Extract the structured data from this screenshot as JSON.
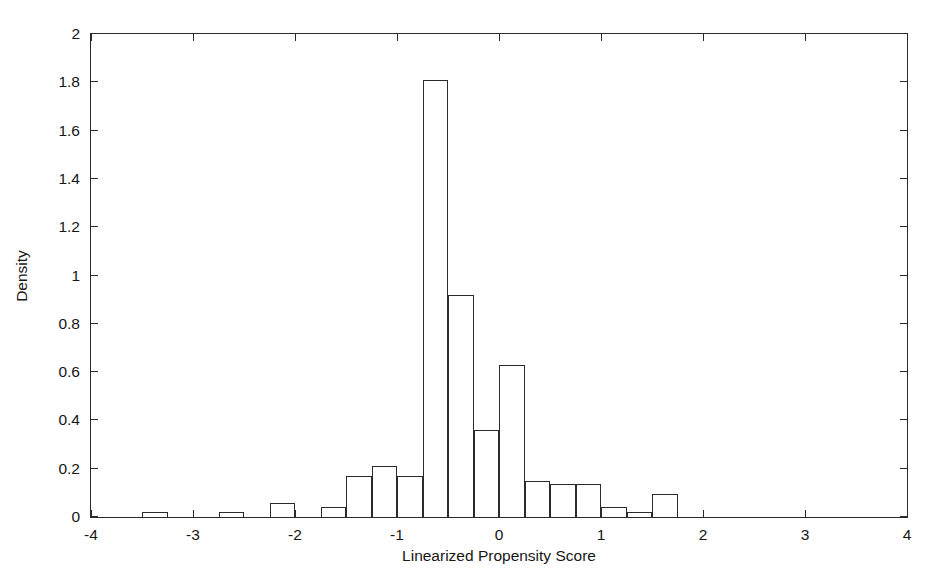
{
  "chart_data": {
    "type": "bar",
    "title": "",
    "subtitle": "",
    "xlabel": "Linearized Propensity Score",
    "ylabel": "Density",
    "xlim": [
      -4,
      4
    ],
    "ylim": [
      0,
      2
    ],
    "grid": false,
    "legend": null,
    "bin_width": 0.25,
    "xticks": [
      -4,
      -3,
      -2,
      -1,
      0,
      1,
      2,
      3,
      4
    ],
    "xtick_labels": [
      "-4",
      "-3",
      "-2",
      "-1",
      "0",
      "1",
      "2",
      "3",
      "4"
    ],
    "yticks": [
      0,
      0.2,
      0.4,
      0.6,
      0.8,
      1,
      1.2,
      1.4,
      1.6,
      1.8,
      2
    ],
    "ytick_labels": [
      "0",
      "0.2",
      "0.4",
      "0.6",
      "0.8",
      "1",
      "1.2",
      "1.4",
      "1.6",
      "1.8",
      "2"
    ],
    "bars": [
      {
        "x0": -3.5,
        "x1": -3.25,
        "value": 0.02
      },
      {
        "x0": -2.75,
        "x1": -2.5,
        "value": 0.02
      },
      {
        "x0": -2.25,
        "x1": -2.0,
        "value": 0.06
      },
      {
        "x0": -1.75,
        "x1": -1.5,
        "value": 0.04
      },
      {
        "x0": -1.5,
        "x1": -1.25,
        "value": 0.17
      },
      {
        "x0": -1.25,
        "x1": -1.0,
        "value": 0.21
      },
      {
        "x0": -1.0,
        "x1": -0.75,
        "value": 0.17
      },
      {
        "x0": -0.75,
        "x1": -0.5,
        "value": 1.81
      },
      {
        "x0": -0.5,
        "x1": -0.25,
        "value": 0.92
      },
      {
        "x0": -0.25,
        "x1": 0.0,
        "value": 0.36
      },
      {
        "x0": 0.0,
        "x1": 0.25,
        "value": 0.63
      },
      {
        "x0": 0.25,
        "x1": 0.5,
        "value": 0.15
      },
      {
        "x0": 0.5,
        "x1": 0.75,
        "value": 0.135
      },
      {
        "x0": 0.75,
        "x1": 1.0,
        "value": 0.135
      },
      {
        "x0": 1.0,
        "x1": 1.25,
        "value": 0.04
      },
      {
        "x0": 1.25,
        "x1": 1.5,
        "value": 0.02
      },
      {
        "x0": 1.5,
        "x1": 1.75,
        "value": 0.095
      }
    ],
    "categories": [
      "-3.50 to -3.25",
      "-2.75 to -2.50",
      "-2.25 to -2.00",
      "-1.75 to -1.50",
      "-1.50 to -1.25",
      "-1.25 to -1.00",
      "-1.00 to -0.75",
      "-0.75 to -0.50",
      "-0.50 to -0.25",
      "-0.25 to 0.00",
      "0.00 to 0.25",
      "0.25 to 0.50",
      "0.50 to 0.75",
      "0.75 to 1.00",
      "1.00 to 1.25",
      "1.25 to 1.50",
      "1.50 to 1.75"
    ],
    "values": [
      0.02,
      0.02,
      0.06,
      0.04,
      0.17,
      0.21,
      0.17,
      1.81,
      0.92,
      0.36,
      0.63,
      0.15,
      0.135,
      0.135,
      0.04,
      0.02,
      0.095
    ],
    "colors": {
      "axis": "#2b2b2b",
      "bar_edge": "#2b2b2b",
      "bar_fill": "none",
      "background": "#ffffff",
      "text": "#161616"
    }
  }
}
